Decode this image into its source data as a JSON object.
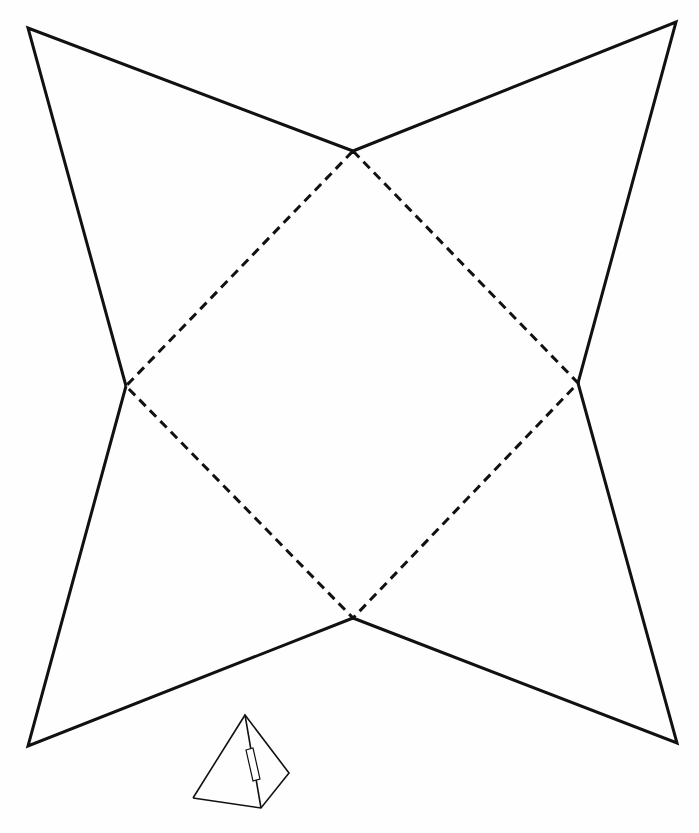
{
  "diagram": {
    "type": "pyramid-net-template",
    "colors": {
      "background": "#fefefe",
      "line": "#111111"
    },
    "base_square": {
      "style": "dashed",
      "role": "fold-lines",
      "vertices": {
        "top": [
          353,
          151
        ],
        "right": [
          578,
          383
        ],
        "bottom": [
          353,
          618
        ],
        "left": [
          126,
          386
        ]
      }
    },
    "faces": [
      {
        "name": "top-left-flap",
        "style": "solid",
        "points": [
          [
            126,
            386
          ],
          [
            28,
            28
          ],
          [
            353,
            151
          ]
        ]
      },
      {
        "name": "top-right-flap",
        "style": "solid",
        "points": [
          [
            353,
            151
          ],
          [
            676,
            22
          ],
          [
            578,
            383
          ]
        ]
      },
      {
        "name": "bottom-right-flap",
        "style": "solid",
        "points": [
          [
            578,
            383
          ],
          [
            677,
            743
          ],
          [
            353,
            618
          ]
        ]
      },
      {
        "name": "bottom-left-flap",
        "style": "solid",
        "points": [
          [
            353,
            618
          ],
          [
            28,
            746
          ],
          [
            126,
            386
          ]
        ]
      }
    ],
    "assembled_pyramid_icon": {
      "apex": [
        245,
        715
      ],
      "base_left": [
        193,
        798
      ],
      "base_front": [
        261,
        808
      ],
      "base_right": [
        289,
        773
      ],
      "tab": {
        "points": [
          [
            246,
            750
          ],
          [
            253,
            748
          ],
          [
            260,
            779
          ],
          [
            253,
            781
          ]
        ]
      }
    }
  }
}
